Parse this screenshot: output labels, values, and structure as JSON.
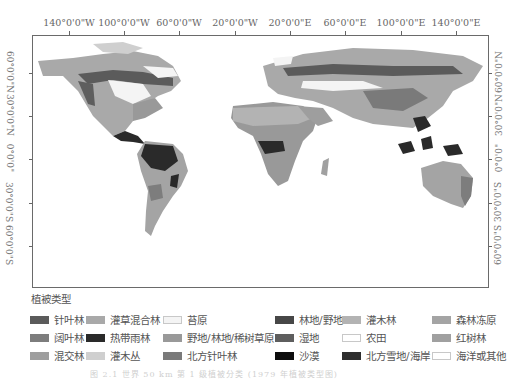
{
  "map": {
    "top_axis_labels": [
      "140°0'0\"W",
      "100°0'0\"W",
      "60°0'0\"W",
      "20°0'0\"W",
      "20°0'0\"E",
      "60°0'0\"E",
      "100°0'0\"E",
      "140°0'0\"E"
    ],
    "left_axis_labels": [
      "60°0'0\"N",
      "30°0'0\"N",
      "0°0'0\"",
      "30°0'0\"S",
      "60°0'0\"S"
    ],
    "right_axis_labels": [
      "60°0'0\"N",
      "30°0'0\"N",
      "0°0'0\"",
      "30°0'0\"S",
      "60°0'0\"S"
    ]
  },
  "legend": {
    "title": "植被类型",
    "items": [
      {
        "label": "针叶林",
        "color": "#5b5b5b"
      },
      {
        "label": "灌草混合林",
        "color": "#a9a9a9"
      },
      {
        "label": "苔原",
        "color": "#f4f4f4"
      },
      {
        "label": "林地/野地",
        "color": "#474747"
      },
      {
        "label": "灌木林",
        "color": "#b3b3b3"
      },
      {
        "label": "森林冻原",
        "color": "#a4a4a4"
      },
      {
        "label": "阔叶林",
        "color": "#7d7d7d"
      },
      {
        "label": "热带雨林",
        "color": "#2a2a2a"
      },
      {
        "label": "野地/林地/稀树草原",
        "color": "#999999"
      },
      {
        "label": "湿地",
        "color": "#5e5e5e"
      },
      {
        "label": "农田",
        "color": "#ffffff"
      },
      {
        "label": "红树林",
        "color": "#a0a0a0"
      },
      {
        "label": "混交林",
        "color": "#9e9e9e"
      },
      {
        "label": "灌木丛",
        "color": "#cfcfcf"
      },
      {
        "label": "北方针叶林",
        "color": "#7a7a7a"
      },
      {
        "label": "沙漠",
        "color": "#0d0d0d"
      },
      {
        "label": "北方雪地/海岸",
        "color": "#2e2e2e"
      },
      {
        "label": "海洋或其他",
        "color": "#ffffff"
      }
    ]
  },
  "caption": "图 2.1 世界 50 km 第 1 级植被分类 (1979 年植被类型图)"
}
